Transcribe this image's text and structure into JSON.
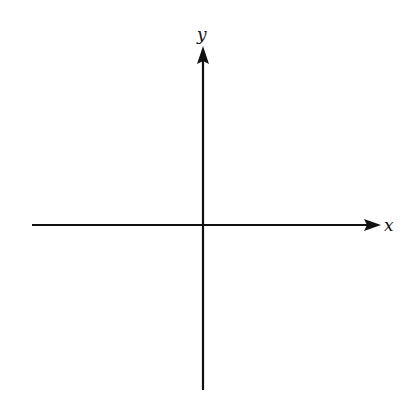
{
  "diagram": {
    "type": "coordinate-axes",
    "x_axis": {
      "label": "x",
      "from": [
        32,
        225
      ],
      "to": [
        381,
        225
      ]
    },
    "y_axis": {
      "label": "y",
      "from": [
        203,
        390
      ],
      "to": [
        203,
        46
      ]
    },
    "origin": [
      203,
      225
    ],
    "line_color": "#111111"
  }
}
